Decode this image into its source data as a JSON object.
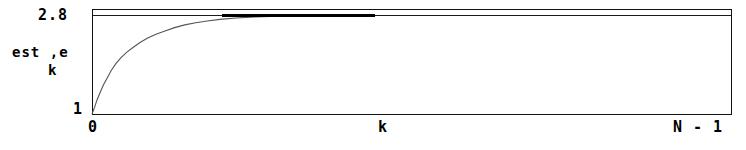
{
  "figure": {
    "y_axis": {
      "label_line1": "est ,e",
      "label_line2": "k",
      "tick_max": "2.8",
      "tick_min": "1"
    },
    "x_axis": {
      "label": "k",
      "tick_min": "0",
      "tick_max": "N - 1"
    },
    "colors": {
      "ink": "#000000",
      "frame": "#111111",
      "curve": "#555555",
      "converged": "#000000",
      "background": "#ffffff"
    }
  },
  "chart_data": {
    "type": "line",
    "title": "",
    "xlabel": "k",
    "ylabel": "est ,e k",
    "xlim": [
      0,
      1
    ],
    "ylim": [
      1,
      2.8
    ],
    "xtick_labels": [
      "0",
      "N - 1"
    ],
    "ytick_labels": [
      "1",
      "2.8"
    ],
    "grid": false,
    "legend": null,
    "annotations": [
      "horizontal reference line drawn at y = 2.8 spanning the full frame width",
      "curve merges with the reference line and is drawn thick from about x = 0.20 to x = 0.44 of the axis width"
    ],
    "series": [
      {
        "name": "est,e_k",
        "x": [
          0.0,
          0.004,
          0.008,
          0.013,
          0.018,
          0.024,
          0.03,
          0.037,
          0.045,
          0.054,
          0.064,
          0.075,
          0.087,
          0.1,
          0.114,
          0.129,
          0.145,
          0.162,
          0.18,
          0.2,
          0.225,
          0.255,
          0.29,
          0.33,
          0.38,
          0.44
        ],
        "y": [
          1.0,
          1.12,
          1.26,
          1.4,
          1.53,
          1.66,
          1.79,
          1.91,
          2.02,
          2.12,
          2.21,
          2.3,
          2.38,
          2.45,
          2.51,
          2.57,
          2.62,
          2.66,
          2.69,
          2.72,
          2.745,
          2.765,
          2.78,
          2.79,
          2.795,
          2.8
        ]
      }
    ]
  }
}
